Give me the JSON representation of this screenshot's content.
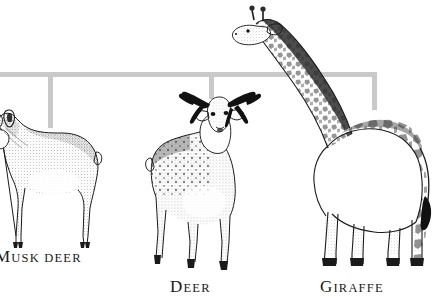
{
  "diagram": {
    "type": "cladogram",
    "title": "",
    "background_color": "#ffffff",
    "bracket_color": "#c9c9c9",
    "ink_color": "#1b1b1b",
    "bracket": {
      "orientation": "top-horizontal-with-drop-lines",
      "horizontal_span_px": [
        0,
        377
      ],
      "horizontal_y_px": 74,
      "stroke_width_px": 5,
      "nodes": [
        {
          "name": "node-musk-deer",
          "x_px": 50,
          "drop_to_y_px": 128
        },
        {
          "name": "node-deer",
          "x_px": 211,
          "drop_to_y_px": 99
        },
        {
          "name": "node-giraffe",
          "x_px": 375,
          "drop_to_y_px": 110
        }
      ]
    },
    "taxa": [
      {
        "id": "musk-deer",
        "label": "MUSK DEER",
        "label_initial": "M",
        "label_rest": "USK DEER",
        "illustration": "musk-deer-illustration",
        "facing": "left",
        "features": "large rounded ears, no antlers, stippled shading, short tail",
        "clipped_at_left_edge": true
      },
      {
        "id": "deer",
        "label": "DEER",
        "label_initial": "D",
        "label_rest": "EER",
        "illustration": "deer-illustration",
        "facing": "front",
        "features": "branched dark antlers, spotted flank, stippled shading"
      },
      {
        "id": "giraffe",
        "label": "GIRAFFE",
        "label_initial": "G",
        "label_rest": "IRAFFE",
        "illustration": "giraffe-illustration",
        "facing": "left",
        "features": "long neck, ossicones, patchwork spot pattern, tufted tail"
      }
    ]
  }
}
